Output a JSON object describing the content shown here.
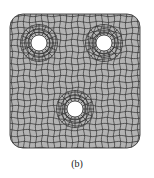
{
  "figure": {
    "caption": "(b)",
    "plate": {
      "x": 10,
      "y": 14,
      "width": 130,
      "height": 134,
      "corner_radius": 13,
      "fill": "#b3b3b3",
      "stroke": "#3a3a3a"
    },
    "mesh_line_color": "#2e2e2e",
    "holes": [
      {
        "name": "top-left-hole",
        "cx": 39,
        "cy": 43,
        "r": 8
      },
      {
        "name": "top-right-hole",
        "cx": 104,
        "cy": 43,
        "r": 8
      },
      {
        "name": "bottom-center-hole",
        "cx": 75,
        "cy": 109,
        "r": 8
      }
    ]
  }
}
